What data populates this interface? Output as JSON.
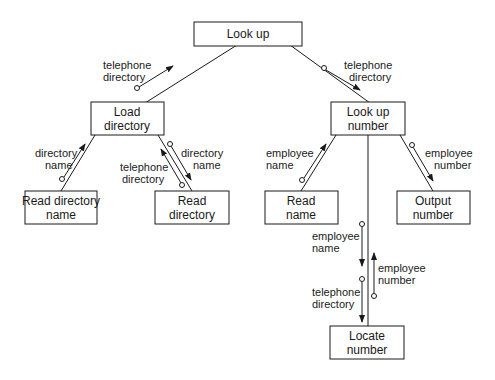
{
  "diagram": {
    "type": "structure-chart",
    "modules": {
      "look_up": [
        "Look up"
      ],
      "load_directory": [
        "Load",
        "directory"
      ],
      "look_up_number": [
        "Look up",
        "number"
      ],
      "read_directory_name": [
        "Read directory",
        "name"
      ],
      "read_directory": [
        "Read",
        "directory"
      ],
      "read_name": [
        "Read",
        "name"
      ],
      "output_number": [
        "Output",
        "number"
      ],
      "locate_number": [
        "Locate",
        "number"
      ]
    },
    "couples": {
      "lu_ld": [
        "telephone",
        "directory"
      ],
      "lu_lun": [
        "telephone",
        "directory"
      ],
      "ld_rdn": [
        "directory",
        "name"
      ],
      "ld_rd_down": [
        "directory",
        "name"
      ],
      "ld_rd_up": [
        "telephone",
        "directory"
      ],
      "lun_rn": [
        "employee",
        "name"
      ],
      "lun_on": [
        "employee",
        "number"
      ],
      "lun_ln_down1": [
        "employee",
        "name"
      ],
      "lun_ln_down2": [
        "telephone",
        "directory"
      ],
      "lun_ln_up": [
        "employee",
        "number"
      ]
    }
  }
}
